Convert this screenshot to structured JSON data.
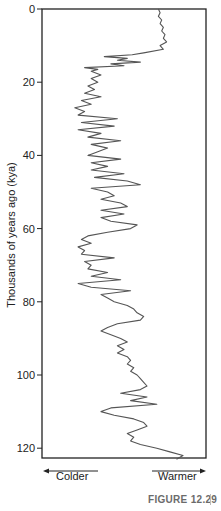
{
  "chart_data": {
    "type": "line",
    "orientation": "vertical-time",
    "title": "",
    "ylabel": "Thousands of years ago (kya)",
    "xlabel": "",
    "x_direction_labels": {
      "left": "Colder",
      "right": "Warmer"
    },
    "yticks": [
      0,
      20,
      40,
      60,
      80,
      100,
      120
    ],
    "ylim": [
      0,
      123
    ],
    "xlim": [
      0,
      100
    ],
    "x_units": "relative temperature index (0 = coldest edge, 100 = warmest edge)",
    "grid": false,
    "legend": null,
    "series": [
      {
        "name": "Temperature proxy",
        "color": "#555555",
        "points": [
          [
            0,
            71
          ],
          [
            1,
            72
          ],
          [
            2,
            71
          ],
          [
            3,
            73
          ],
          [
            4,
            72
          ],
          [
            5,
            74
          ],
          [
            6,
            73
          ],
          [
            7,
            75
          ],
          [
            8,
            74
          ],
          [
            9,
            76
          ],
          [
            10,
            72
          ],
          [
            11,
            74
          ],
          [
            12,
            62
          ],
          [
            12.5,
            55
          ],
          [
            13,
            38
          ],
          [
            13.5,
            52
          ],
          [
            14,
            46
          ],
          [
            14.5,
            60
          ],
          [
            15,
            42
          ],
          [
            15.5,
            50
          ],
          [
            16,
            26
          ],
          [
            16.5,
            34
          ],
          [
            17,
            30
          ],
          [
            18,
            36
          ],
          [
            19,
            30
          ],
          [
            20,
            34
          ],
          [
            21,
            28
          ],
          [
            22,
            32
          ],
          [
            23,
            26
          ],
          [
            24,
            36
          ],
          [
            25,
            24
          ],
          [
            26,
            30
          ],
          [
            27,
            20
          ],
          [
            28,
            26
          ],
          [
            29,
            22
          ],
          [
            30,
            46
          ],
          [
            31,
            24
          ],
          [
            32,
            44
          ],
          [
            33,
            22
          ],
          [
            34,
            36
          ],
          [
            35,
            28
          ],
          [
            36,
            48
          ],
          [
            37,
            30
          ],
          [
            38,
            40
          ],
          [
            39,
            34
          ],
          [
            40,
            28
          ],
          [
            41,
            48
          ],
          [
            42,
            30
          ],
          [
            43,
            40
          ],
          [
            44,
            30
          ],
          [
            45,
            50
          ],
          [
            46,
            32
          ],
          [
            47,
            52
          ],
          [
            48,
            60
          ],
          [
            49,
            30
          ],
          [
            50,
            40
          ],
          [
            51,
            44
          ],
          [
            52,
            36
          ],
          [
            53,
            48
          ],
          [
            54,
            52
          ],
          [
            55,
            36
          ],
          [
            56,
            50
          ],
          [
            57,
            36
          ],
          [
            58,
            42
          ],
          [
            59,
            58
          ],
          [
            60,
            54
          ],
          [
            61,
            40
          ],
          [
            62,
            28
          ],
          [
            63,
            24
          ],
          [
            64,
            30
          ],
          [
            65,
            22
          ],
          [
            66,
            26
          ],
          [
            67,
            24
          ],
          [
            68,
            44
          ],
          [
            69,
            26
          ],
          [
            70,
            30
          ],
          [
            71,
            28
          ],
          [
            72,
            40
          ],
          [
            73,
            30
          ],
          [
            74,
            48
          ],
          [
            75,
            22
          ],
          [
            76,
            30
          ],
          [
            77,
            54
          ],
          [
            78,
            36
          ],
          [
            79,
            40
          ],
          [
            80,
            44
          ],
          [
            81,
            52
          ],
          [
            82,
            56
          ],
          [
            83,
            58
          ],
          [
            84,
            62
          ],
          [
            85,
            60
          ],
          [
            86,
            46
          ],
          [
            87,
            40
          ],
          [
            88,
            36
          ],
          [
            89,
            42
          ],
          [
            90,
            48
          ],
          [
            91,
            52
          ],
          [
            92,
            46
          ],
          [
            93,
            50
          ],
          [
            94,
            46
          ],
          [
            95,
            52
          ],
          [
            96,
            54
          ],
          [
            97,
            52
          ],
          [
            98,
            56
          ],
          [
            99,
            54
          ],
          [
            100,
            58
          ],
          [
            101,
            60
          ],
          [
            102,
            62
          ],
          [
            103,
            64
          ],
          [
            104,
            60
          ],
          [
            105,
            48
          ],
          [
            106,
            64
          ],
          [
            107,
            54
          ],
          [
            108,
            70
          ],
          [
            109,
            42
          ],
          [
            110,
            36
          ],
          [
            111,
            44
          ],
          [
            112,
            56
          ],
          [
            113,
            62
          ],
          [
            114,
            64
          ],
          [
            115,
            58
          ],
          [
            116,
            52
          ],
          [
            117,
            56
          ],
          [
            118,
            54
          ],
          [
            119,
            60
          ],
          [
            120,
            70
          ],
          [
            121,
            78
          ],
          [
            122,
            86
          ],
          [
            123,
            82
          ]
        ]
      }
    ]
  },
  "figure": {
    "y_axis_label": "Thousands of years ago (kya)",
    "ticks": [
      "0",
      "20",
      "40",
      "60",
      "80",
      "100",
      "120"
    ],
    "colder_label": "Colder",
    "warmer_label": "Warmer",
    "caption": "FIGURE 12.29"
  }
}
